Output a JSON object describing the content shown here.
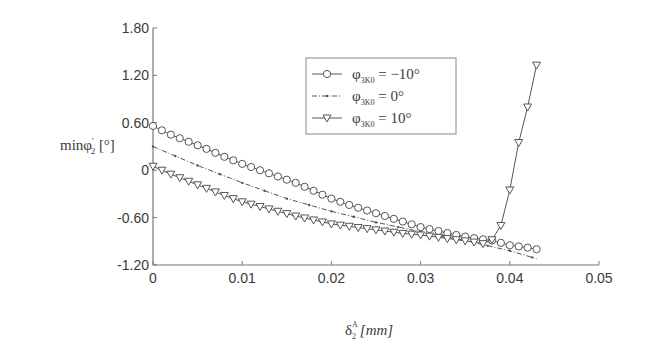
{
  "chart_data": {
    "type": "line",
    "title": "",
    "xlabel": "δ2^A [mm]",
    "ylabel": "minφ2' [°]",
    "xlim": [
      0,
      0.05
    ],
    "ylim": [
      -1.2,
      1.8
    ],
    "x_ticks": [
      "0",
      "0.01",
      "0.02",
      "0.03",
      "0.04",
      "0.05"
    ],
    "y_ticks": [
      "1.80",
      "1.20",
      "0.60",
      "0",
      "-0.60",
      "-1.20"
    ],
    "grid": false,
    "legend_position": "upper-center",
    "series": [
      {
        "name": "φ3K0 = −10°",
        "marker": "circle",
        "line": "solid",
        "x": [
          0,
          0.002,
          0.004,
          0.006,
          0.008,
          0.01,
          0.012,
          0.014,
          0.016,
          0.018,
          0.02,
          0.022,
          0.024,
          0.026,
          0.028,
          0.03,
          0.032,
          0.034,
          0.036,
          0.038,
          0.04,
          0.042,
          0.043
        ],
        "y": [
          0.56,
          0.45,
          0.36,
          0.27,
          0.17,
          0.08,
          0.0,
          -0.08,
          -0.16,
          -0.26,
          -0.36,
          -0.44,
          -0.51,
          -0.58,
          -0.65,
          -0.72,
          -0.77,
          -0.82,
          -0.86,
          -0.89,
          -0.95,
          -0.98,
          -1.0
        ]
      },
      {
        "name": "φ3K0 = 0°",
        "marker": "dot",
        "line": "dash-dot",
        "x": [
          0,
          0.005,
          0.01,
          0.015,
          0.02,
          0.025,
          0.03,
          0.035,
          0.04,
          0.043
        ],
        "y": [
          0.3,
          0.06,
          -0.16,
          -0.36,
          -0.52,
          -0.66,
          -0.78,
          -0.89,
          -1.02,
          -1.12
        ]
      },
      {
        "name": "φ3K0 = 10°",
        "marker": "triangle-down",
        "line": "solid",
        "x": [
          0,
          0.002,
          0.004,
          0.006,
          0.008,
          0.01,
          0.012,
          0.014,
          0.016,
          0.018,
          0.02,
          0.022,
          0.024,
          0.026,
          0.028,
          0.03,
          0.032,
          0.034,
          0.036,
          0.037,
          0.038,
          0.039,
          0.04,
          0.041,
          0.042,
          0.043
        ],
        "y": [
          0.05,
          -0.05,
          -0.14,
          -0.23,
          -0.32,
          -0.4,
          -0.46,
          -0.52,
          -0.58,
          -0.63,
          -0.68,
          -0.71,
          -0.74,
          -0.77,
          -0.8,
          -0.82,
          -0.85,
          -0.88,
          -0.91,
          -0.93,
          -0.88,
          -0.7,
          -0.25,
          0.35,
          0.8,
          1.33
        ]
      }
    ]
  },
  "legend": {
    "items": [
      {
        "symbol": "φ",
        "sub": "3K0",
        "value": " = −10°"
      },
      {
        "symbol": "φ",
        "sub": "3K0",
        "value": " = 0°"
      },
      {
        "symbol": "φ",
        "sub": "3K0",
        "value": " = 10°"
      }
    ]
  },
  "axes": {
    "ylabel_main": "minφ",
    "ylabel_sup": "'",
    "ylabel_sub": "2",
    "ylabel_unit": " [°]",
    "xlabel_main": "δ",
    "xlabel_sup": "A",
    "xlabel_sub": "2",
    "xlabel_unit": "[mm]"
  },
  "colors": {
    "axis": "#777777",
    "series": "#555555",
    "text": "#3a3a3a"
  }
}
